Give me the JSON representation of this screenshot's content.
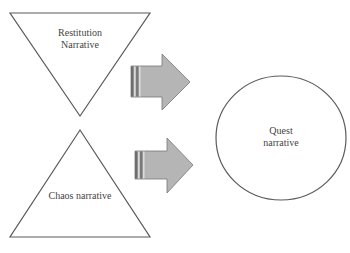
{
  "diagram": {
    "nodes": [
      {
        "id": "restitution",
        "shape": "inverted-triangle",
        "label_lines": [
          "Restitution",
          "Narrative"
        ]
      },
      {
        "id": "chaos",
        "shape": "triangle",
        "label": "Chaos narrative"
      },
      {
        "id": "quest",
        "shape": "circle",
        "label_lines": [
          "Quest",
          "narrative"
        ]
      }
    ],
    "edges": [
      {
        "from": "restitution",
        "to": "quest",
        "style": "block-arrow"
      },
      {
        "from": "chaos",
        "to": "quest",
        "style": "block-arrow"
      }
    ],
    "labels": {
      "restitution_line1": "Restitution",
      "restitution_line2": "Narrative",
      "chaos": "Chaos narrative",
      "quest_line1": "Quest",
      "quest_line2": "narrative"
    },
    "caption_fragment": "",
    "colors": {
      "outline": "#555555",
      "arrow_fill": "#b5b5b5",
      "arrow_stroke": "#777777",
      "arrow_stripe_dark": "#6e6e6e",
      "arrow_stripe_light": "#d8d8d8",
      "text": "#444444",
      "background": "#ffffff"
    }
  }
}
